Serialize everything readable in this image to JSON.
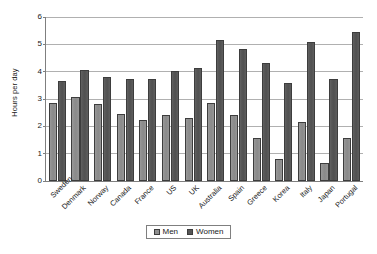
{
  "chart_data": {
    "type": "bar",
    "title": "",
    "subtitle": "",
    "xlabel": "",
    "ylabel": "Hours per day",
    "ylim": [
      0,
      6
    ],
    "ytick_labels": [
      "0",
      "1",
      "2",
      "3",
      "4",
      "5",
      "6"
    ],
    "yticks": [
      0,
      1,
      2,
      3,
      4,
      5,
      6
    ],
    "grid": true,
    "legend_position": "bottom-center",
    "categories": [
      "Sweden",
      "Denmark",
      "Norway",
      "Canada",
      "France",
      "US",
      "UK",
      "Australia",
      "Spain",
      "Greece",
      "Korea",
      "Italy",
      "Japan",
      "Portugal"
    ],
    "series": [
      {
        "name": "Men",
        "color": "#8f8f8f",
        "values": [
          2.85,
          3.08,
          2.82,
          2.45,
          2.22,
          2.4,
          2.3,
          2.85,
          2.4,
          1.57,
          0.82,
          2.15,
          0.67,
          1.57
        ]
      },
      {
        "name": "Women",
        "color": "#565656",
        "values": [
          3.67,
          4.05,
          3.8,
          3.73,
          3.73,
          4.02,
          4.13,
          5.17,
          4.82,
          4.32,
          3.58,
          5.1,
          3.73,
          5.45
        ]
      }
    ]
  },
  "legend": {
    "entries": [
      {
        "label": "Men",
        "swatch": "men"
      },
      {
        "label": "Women",
        "swatch": "women"
      }
    ]
  }
}
